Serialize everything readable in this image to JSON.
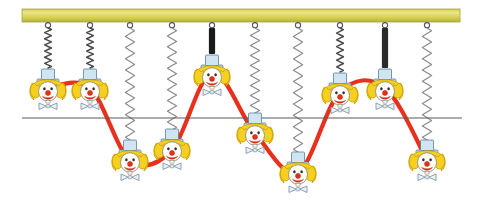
{
  "figure": {
    "width": 482,
    "height": 209,
    "background_color": "#ffffff"
  },
  "support_bar": {
    "name": "support-bar",
    "x": 22,
    "y": 9,
    "width": 438,
    "height": 13,
    "fill_color": "#d8d45a",
    "highlight_color": "#e8e481",
    "edge_color": "#a8a43c"
  },
  "equilibrium_line": {
    "name": "equilibrium-line",
    "x1": 22,
    "x2": 462,
    "y": 118,
    "color": "#5a5a5a",
    "stroke_width": 1.2
  },
  "wave_curve": {
    "name": "wave-curve",
    "color": "#e8301c",
    "stroke_width": 4.2,
    "amplitude": 47,
    "baseline_y": 118,
    "points": [
      {
        "x": 48,
        "y": 88
      },
      {
        "x": 90,
        "y": 88
      },
      {
        "x": 130,
        "y": 160
      },
      {
        "x": 172,
        "y": 150
      },
      {
        "x": 212,
        "y": 73
      },
      {
        "x": 255,
        "y": 133
      },
      {
        "x": 298,
        "y": 172
      },
      {
        "x": 340,
        "y": 92
      },
      {
        "x": 385,
        "y": 88
      },
      {
        "x": 427,
        "y": 160
      }
    ]
  },
  "springs": [
    {
      "name": "spring-1",
      "x": 48,
      "top": 22,
      "bottom": 68,
      "state": "compressed",
      "color": "#4a4a4a",
      "coils": 13,
      "solid": false
    },
    {
      "name": "spring-2",
      "x": 90,
      "top": 22,
      "bottom": 68,
      "state": "compressed",
      "color": "#4a4a4a",
      "coils": 13,
      "solid": false
    },
    {
      "name": "spring-3",
      "x": 130,
      "top": 22,
      "bottom": 140,
      "state": "stretched",
      "color": "#8a8a8a",
      "coils": 20,
      "solid": false
    },
    {
      "name": "spring-4",
      "x": 172,
      "top": 22,
      "bottom": 130,
      "state": "stretched",
      "color": "#8a8a8a",
      "coils": 19,
      "solid": false
    },
    {
      "name": "spring-5",
      "x": 212,
      "top": 22,
      "bottom": 54,
      "state": "fully-compressed",
      "color": "#1a1a1a",
      "coils": 0,
      "solid": true
    },
    {
      "name": "spring-6",
      "x": 255,
      "top": 22,
      "bottom": 113,
      "state": "stretched",
      "color": "#8a8a8a",
      "coils": 17,
      "solid": false
    },
    {
      "name": "spring-7",
      "x": 298,
      "top": 22,
      "bottom": 152,
      "state": "stretched",
      "color": "#8a8a8a",
      "coils": 22,
      "solid": false
    },
    {
      "name": "spring-8",
      "x": 340,
      "top": 22,
      "bottom": 72,
      "state": "compressed",
      "color": "#4a4a4a",
      "coils": 13,
      "solid": false
    },
    {
      "name": "spring-9",
      "x": 385,
      "top": 22,
      "bottom": 68,
      "state": "fully-compressed",
      "color": "#2a2a2a",
      "coils": 0,
      "solid": true
    },
    {
      "name": "spring-10",
      "x": 427,
      "top": 22,
      "bottom": 140,
      "state": "stretched",
      "color": "#8a8a8a",
      "coils": 20,
      "solid": false
    }
  ],
  "clowns": [
    {
      "name": "clown-1",
      "x": 48,
      "y": 92,
      "label": "1"
    },
    {
      "name": "clown-2",
      "x": 90,
      "y": 92,
      "label": "2"
    },
    {
      "name": "clown-3",
      "x": 130,
      "y": 163,
      "label": "3"
    },
    {
      "name": "clown-4",
      "x": 172,
      "y": 152,
      "label": "4"
    },
    {
      "name": "clown-5",
      "x": 212,
      "y": 78,
      "label": "5"
    },
    {
      "name": "clown-6",
      "x": 255,
      "y": 136,
      "label": "6"
    },
    {
      "name": "clown-7",
      "x": 298,
      "y": 175,
      "label": "7"
    },
    {
      "name": "clown-8",
      "x": 340,
      "y": 96,
      "label": "8"
    },
    {
      "name": "clown-9",
      "x": 385,
      "y": 92,
      "label": "9"
    },
    {
      "name": "clown-10",
      "x": 427,
      "y": 163,
      "label": "10"
    }
  ],
  "clown_style": {
    "hat_color": "#bcd9e8",
    "hat_outline": "#5b7f96",
    "hair_color": "#f5d020",
    "hair_outline": "#c79a00",
    "face_color": "#fffdf6",
    "face_outline": "#8a8a78",
    "nose_color": "#e8301c",
    "mouth_color": "#e8301c",
    "bowtie_color": "#e9eff4",
    "bowtie_outline": "#7d93a3",
    "eye_color": "#333333"
  }
}
